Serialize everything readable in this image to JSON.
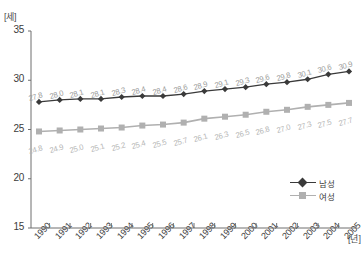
{
  "chart_data": {
    "type": "line",
    "title": "",
    "xlabel": "[년]",
    "ylabel": "[세]",
    "ylim": [
      15,
      35
    ],
    "yticks": [
      "35",
      "30",
      "25",
      "20",
      "15"
    ],
    "ytick_values": [
      35,
      30,
      25,
      20,
      15
    ],
    "grid": false,
    "legend_position": "bottom-right",
    "categories": [
      "1990",
      "1991",
      "1992",
      "1993",
      "1994",
      "1995",
      "1996",
      "1997",
      "1998",
      "1999",
      "2000",
      "2001",
      "2002",
      "2003",
      "2004",
      "2005"
    ],
    "series": [
      {
        "name": "남성",
        "color": "#3a3a3a",
        "marker": "diamond",
        "values": [
          27.8,
          28.0,
          28.1,
          28.1,
          28.3,
          28.4,
          28.4,
          28.6,
          28.9,
          29.1,
          29.3,
          29.6,
          29.8,
          30.1,
          30.6,
          30.9
        ],
        "labels": [
          "27.8",
          "28.0",
          "28.1",
          "28.1",
          "28.3",
          "28.4",
          "28.4",
          "28.6",
          "28.9",
          "29.1",
          "29.3",
          "29.6",
          "29.8",
          "30.1",
          "30.6",
          "30.9"
        ]
      },
      {
        "name": "여성",
        "color": "#b0b0b0",
        "marker": "square",
        "values": [
          24.8,
          24.9,
          25.0,
          25.1,
          25.2,
          25.4,
          25.5,
          25.7,
          26.1,
          26.3,
          26.5,
          26.8,
          27.0,
          27.3,
          27.5,
          27.7
        ],
        "labels": [
          "24.8",
          "24.9",
          "25.0",
          "25.1",
          "25.2",
          "25.4",
          "25.5",
          "25.7",
          "26.1",
          "26.3",
          "26.5",
          "26.8",
          "27.0",
          "27.3",
          "27.5",
          "27.7"
        ]
      }
    ]
  },
  "axis": {
    "unit_y": "[세]",
    "unit_x": "[년]"
  },
  "legend": {
    "items": [
      {
        "label": "남성"
      },
      {
        "label": "여성"
      }
    ]
  }
}
